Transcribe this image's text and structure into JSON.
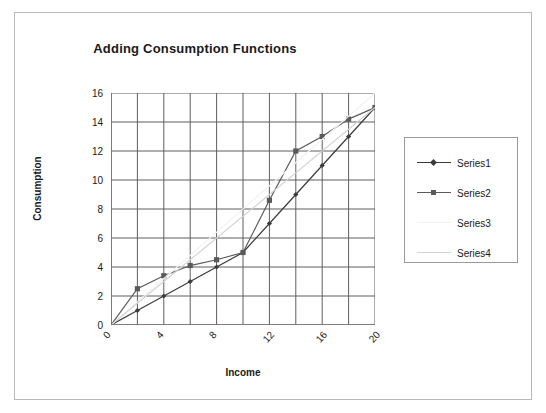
{
  "chart_data": {
    "type": "line",
    "title": "Adding Consumption Functions",
    "xlabel": "Income",
    "ylabel": "Consumption",
    "xlim": [
      0,
      20
    ],
    "ylim": [
      0,
      16
    ],
    "xticks": [
      "0",
      "4",
      "8",
      "12",
      "16",
      "20"
    ],
    "xtick_values": [
      0,
      4,
      8,
      12,
      16,
      20
    ],
    "yticks": [
      "0",
      "2",
      "4",
      "6",
      "8",
      "10",
      "12",
      "14",
      "16"
    ],
    "ytick_values": [
      0,
      2,
      4,
      6,
      8,
      10,
      12,
      14,
      16
    ],
    "grid": true,
    "grid_x_step": 2,
    "grid_y_step": 2,
    "legend_position": "right",
    "series": [
      {
        "name": "Series1",
        "marker": "diamond",
        "color": "#3b3b3b",
        "x": [
          0,
          2,
          4,
          6,
          8,
          10,
          12,
          14,
          16,
          18,
          20
        ],
        "y": [
          0,
          1,
          2,
          3,
          4,
          5,
          7,
          9,
          11,
          13,
          15
        ]
      },
      {
        "name": "Series2",
        "marker": "square",
        "color": "#5a5a5a",
        "x": [
          0,
          2,
          4,
          6,
          8,
          10,
          12,
          14,
          16,
          18,
          20
        ],
        "y": [
          0,
          2.5,
          3.4,
          4.1,
          4.5,
          5,
          8.6,
          12,
          13,
          14.2,
          15
        ]
      },
      {
        "name": "Series3",
        "marker": "none",
        "color": "#f2f2f2",
        "x": [
          0,
          20
        ],
        "y": [
          0,
          16
        ]
      },
      {
        "name": "Series4",
        "marker": "none",
        "color": "#d3d3d3",
        "x": [
          0,
          20
        ],
        "y": [
          0,
          15
        ]
      }
    ],
    "legend_entries": [
      "Series1",
      "Series2",
      "Series3",
      "Series4"
    ],
    "axis_color": "#6e6e6e",
    "grid_color": "#5f5f5f",
    "frame_color": "#b9b9b9"
  }
}
